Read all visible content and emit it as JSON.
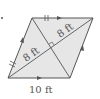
{
  "diagram": {
    "type": "parallelogram-with-diagonals",
    "colors": {
      "fill": "#e6e6e6",
      "stroke": "#555555",
      "text": "#555555"
    },
    "labels": {
      "diag_upper": "8 ft",
      "diag_lower": "8 ft",
      "bottom_side": "10 ft"
    },
    "marks": {
      "right_angle": "diagonals perpendicular",
      "congruent_ticks": "double tick marks on top and left sides",
      "parallel_arrows": "arrows on opposite sides"
    }
  }
}
